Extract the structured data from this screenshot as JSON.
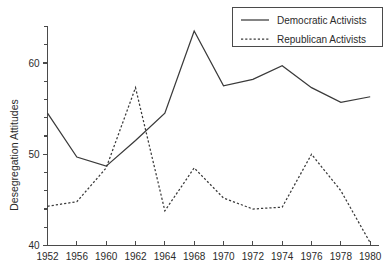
{
  "chart_data": {
    "type": "line",
    "title": "",
    "xlabel": "",
    "ylabel": "Desegregation Attitudes",
    "categories": [
      "1952",
      "1956",
      "1960",
      "1962",
      "1964",
      "1968",
      "1970",
      "1972",
      "1974",
      "1976",
      "1978",
      "1980"
    ],
    "x_tick_labels": [
      "1952",
      "1956",
      "1960",
      "1962",
      "1964",
      "1968",
      "1970",
      "1972",
      "1974",
      "1976",
      "1978",
      "1980"
    ],
    "y_tick_labels": [
      "40",
      "50",
      "60"
    ],
    "y_major_ticks": [
      40,
      50,
      60
    ],
    "y_minor_tick_step": 2,
    "ylim": [
      40,
      65
    ],
    "grid": false,
    "legend_position": "top-right",
    "series": [
      {
        "name": "Democratic Activists",
        "style": "solid",
        "color": "#3a3a3a",
        "values": [
          54.5,
          49.7,
          48.7,
          51.5,
          54.5,
          63.5,
          57.5,
          58.2,
          59.7,
          57.3,
          55.7,
          56.3
        ]
      },
      {
        "name": "Republican Activists",
        "style": "dotted",
        "color": "#3a3a3a",
        "values": [
          44.3,
          44.8,
          48.5,
          57.3,
          43.8,
          48.5,
          45.2,
          44.0,
          44.2,
          50.0,
          46.0,
          40.3
        ]
      }
    ]
  },
  "legend": {
    "entries": [
      {
        "label": "Democratic Activists",
        "style": "solid"
      },
      {
        "label": "Republican Activists",
        "style": "dotted"
      }
    ]
  },
  "axes": {
    "y_axis_title": "Desegregation Attitudes"
  }
}
